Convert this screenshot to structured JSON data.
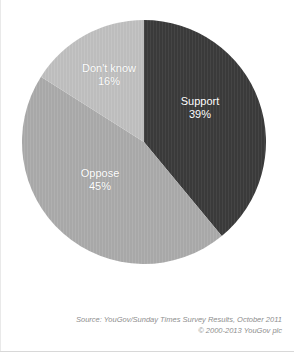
{
  "chart_data": {
    "type": "pie",
    "title": "",
    "categories": [
      "Support",
      "Oppose",
      "Don't know"
    ],
    "values": [
      39,
      45,
      16
    ],
    "value_suffix": "%",
    "labels": [
      {
        "name": "Support",
        "value": 39,
        "display_value": "39%",
        "color": "#3a3a3a",
        "label_color": "#ffffff"
      },
      {
        "name": "Oppose",
        "value": 45,
        "display_value": "45%",
        "color": "#a8a8a8",
        "label_color": "#ffffff"
      },
      {
        "name": "Don't know",
        "value": 16,
        "display_value": "16%",
        "color": "#bdbdbd",
        "label_color": "#ffffff"
      }
    ],
    "start_angle_deg": 0,
    "direction": "clockwise",
    "legend": "none",
    "grid": false,
    "background": "#ffffff"
  },
  "footer": {
    "source_line": "Source: YouGov/Sunday Times Survey Results, October 2011",
    "copyright_line": "© 2000-2013 YouGov plc"
  }
}
